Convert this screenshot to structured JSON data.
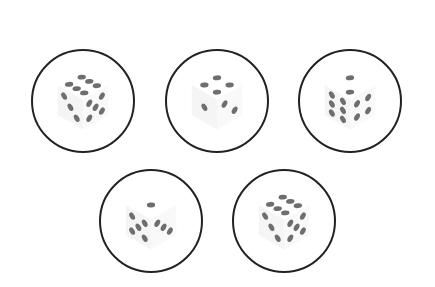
{
  "figure": {
    "top_text_cut": "",
    "outline_color": "#222222",
    "pip_color": "#6e6e6e",
    "face_shade": "#ececec",
    "circles": [
      {
        "id": "die-1",
        "cx": 83,
        "cy": 101,
        "r": 51,
        "top_pips": 6,
        "left_pips": 3,
        "right_pips": 5
      },
      {
        "id": "die-2",
        "cx": 217,
        "cy": 101,
        "r": 51,
        "top_pips": 4,
        "left_pips": 1,
        "right_pips": 2
      },
      {
        "id": "die-3",
        "cx": 350,
        "cy": 101,
        "r": 51,
        "top_pips": 2,
        "left_pips": 6,
        "right_pips": 4
      },
      {
        "id": "die-4",
        "cx": 151,
        "cy": 221,
        "r": 51,
        "top_pips": 1,
        "left_pips": 5,
        "right_pips": 3
      },
      {
        "id": "die-5",
        "cx": 284,
        "cy": 221,
        "r": 51,
        "top_pips": 6,
        "left_pips": 3,
        "right_pips": 5
      }
    ]
  }
}
